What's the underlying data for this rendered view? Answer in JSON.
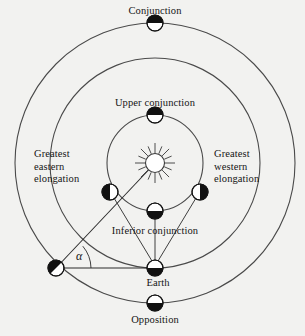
{
  "figure": {
    "background_color": "#f2f2f0",
    "stroke_color": "#4a4a4a",
    "body_dark_color": "#111111",
    "body_light_color": "#ffffff",
    "width": 305,
    "height": 336
  },
  "labels": {
    "conjunction": "Conjunction",
    "upper_conjunction": "Upper conjunction",
    "greatest_eastern_elongation": "Greatest\neastern\nelongation",
    "greatest_western_elongation": "Greatest\nwestern\nelongation",
    "inferior_conjunction": "Inferior conjunction",
    "earth": "Earth",
    "opposition": "Opposition",
    "angle_alpha": "α"
  },
  "diagram_data": {
    "type": "orbital-configuration-diagram",
    "center": {
      "x": 155,
      "y": 163,
      "name": "Sun"
    },
    "orbits": [
      {
        "name": "inferior-planet-orbit",
        "radius": 48
      },
      {
        "name": "earth-orbit",
        "radius": 105
      },
      {
        "name": "superior-planet-orbit",
        "radius": 140
      }
    ],
    "bodies": [
      {
        "name": "conjunction",
        "x": 155,
        "y": 23,
        "radius": 8,
        "phase": "top-dark",
        "orbit": "superior-planet-orbit"
      },
      {
        "name": "upper-conjunction",
        "x": 155,
        "y": 115,
        "radius": 8,
        "phase": "top-dark",
        "orbit": "inferior-planet-orbit"
      },
      {
        "name": "greatest-eastern-elongation",
        "x": 110,
        "y": 192,
        "radius": 8,
        "phase": "left-dark",
        "orbit": "inferior-planet-orbit"
      },
      {
        "name": "greatest-western-elongation",
        "x": 200,
        "y": 192,
        "radius": 8,
        "phase": "right-dark",
        "orbit": "inferior-planet-orbit"
      },
      {
        "name": "inferior-conjunction",
        "x": 155,
        "y": 211,
        "radius": 8,
        "phase": "bottom-dark",
        "orbit": "inferior-planet-orbit"
      },
      {
        "name": "superior-planet-quadrature",
        "x": 56,
        "y": 268,
        "radius": 8,
        "phase": "lower-left-dark",
        "orbit": "superior-planet-orbit"
      },
      {
        "name": "earth",
        "x": 155,
        "y": 268,
        "radius": 8,
        "phase": "bottom-dark",
        "orbit": "earth-orbit"
      },
      {
        "name": "opposition",
        "x": 155,
        "y": 303,
        "radius": 8,
        "phase": "bottom-dark",
        "orbit": "superior-planet-orbit"
      }
    ],
    "sight_lines": [
      {
        "name": "planet-to-sun",
        "from": [
          56,
          268
        ],
        "to": [
          155,
          163
        ]
      },
      {
        "name": "planet-to-earth",
        "from": [
          56,
          268
        ],
        "to": [
          155,
          268
        ]
      },
      {
        "name": "earth-to-eastern-elongation",
        "from": [
          155,
          268
        ],
        "to": [
          110,
          192
        ]
      },
      {
        "name": "earth-to-western-elongation",
        "from": [
          155,
          268
        ],
        "to": [
          200,
          192
        ]
      },
      {
        "name": "earth-to-inferior-conjunction",
        "from": [
          155,
          268
        ],
        "to": [
          155,
          211
        ]
      }
    ],
    "angle_marker": {
      "name": "alpha",
      "vertex": [
        56,
        268
      ],
      "value_symbol": "α",
      "between": [
        "planet-to-sun",
        "planet-to-earth"
      ]
    }
  },
  "label_positions": {
    "conjunction": {
      "left": 104,
      "top": 5,
      "width": 102
    },
    "upper_conjunction": {
      "left": 93,
      "top": 97,
      "width": 124
    },
    "greatest_eastern_elongation": {
      "left": 34,
      "top": 148,
      "width": 62
    },
    "greatest_western_elongation": {
      "left": 214,
      "top": 148,
      "width": 68
    },
    "inferior_conjunction": {
      "left": 95,
      "top": 225,
      "width": 120
    },
    "earth": {
      "left": 130,
      "top": 277,
      "width": 56
    },
    "opposition": {
      "left": 112,
      "top": 314,
      "width": 86
    },
    "angle_alpha": {
      "left": 76,
      "top": 249
    }
  }
}
